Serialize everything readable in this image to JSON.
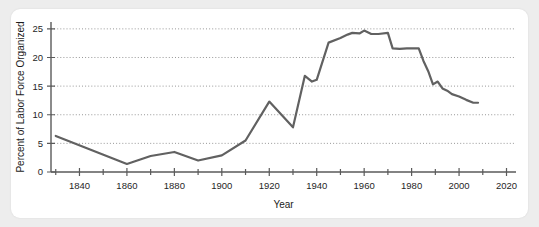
{
  "chart_data": {
    "type": "line",
    "title": "",
    "xlabel": "Year",
    "ylabel": "Percent of Labor Force Organized",
    "xlim": [
      1828,
      2024
    ],
    "ylim": [
      0,
      26.2
    ],
    "xticks_major": [
      1840,
      1860,
      1880,
      1900,
      1920,
      1940,
      1960,
      1980,
      2000,
      2020
    ],
    "xticks_minor": [
      1830,
      1850,
      1870,
      1890,
      1910,
      1930,
      1950,
      1970,
      1990,
      2010
    ],
    "yticks": [
      0,
      5,
      10,
      15,
      20,
      25
    ],
    "grid": "horizontal-dotted",
    "legend": "none",
    "line_color": "#616161",
    "axis_color": "#5a5a5a",
    "background_color": "#ffffff",
    "page_background_color": "#ededed",
    "series": [
      {
        "name": "Percent of Labor Force Organized",
        "x": [
          1830,
          1860,
          1870,
          1880,
          1890,
          1900,
          1910,
          1920,
          1930,
          1935,
          1938,
          1940,
          1945,
          1950,
          1953,
          1955,
          1958,
          1960,
          1963,
          1966,
          1970,
          1972,
          1975,
          1978,
          1980,
          1983,
          1985,
          1987,
          1989,
          1991,
          1993,
          1995,
          1997,
          2000,
          2003,
          2006,
          2008
        ],
        "values": [
          6.3,
          1.4,
          2.8,
          3.5,
          2.0,
          2.9,
          5.5,
          12.3,
          7.8,
          16.8,
          15.8,
          16.1,
          22.6,
          23.4,
          24.0,
          24.3,
          24.2,
          24.7,
          24.1,
          24.1,
          24.3,
          21.6,
          21.5,
          21.6,
          21.6,
          21.6,
          19.4,
          17.6,
          15.3,
          15.8,
          14.6,
          14.2,
          13.6,
          13.2,
          12.6,
          12.1,
          12.1
        ]
      }
    ]
  },
  "axis_labels": {
    "y_title": "Percent of Labor Force Organized",
    "x_title": "Year",
    "y_ticks": [
      "0",
      "5",
      "10",
      "15",
      "20",
      "25"
    ],
    "x_ticks": [
      "1840",
      "1860",
      "1880",
      "1900",
      "1920",
      "1940",
      "1960",
      "1980",
      "2000",
      "2020"
    ]
  }
}
